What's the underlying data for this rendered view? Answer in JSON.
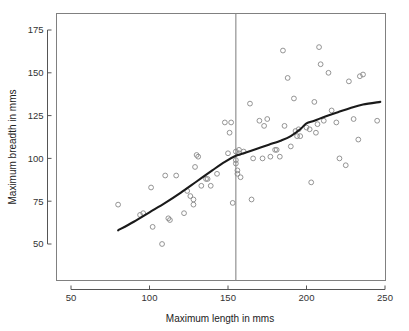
{
  "chart_data": {
    "type": "scatter",
    "title": "",
    "subtitle": "",
    "xlabel": "Maximum length in mms",
    "ylabel": "Maximum breadth in mms",
    "xlim": [
      37,
      262
    ],
    "ylim": [
      42,
      181
    ],
    "xticks": [
      50,
      100,
      150,
      200,
      250
    ],
    "xtick_labels": [
      "50",
      "100",
      "150",
      "200",
      "250"
    ],
    "yticks": [
      50,
      75,
      100,
      125,
      150,
      175
    ],
    "ytick_labels": [
      "50",
      "75",
      "100",
      "125",
      "150",
      "175"
    ],
    "grid": false,
    "legend": null,
    "point_marker": "open-circle",
    "point_color": "#888888",
    "smoother_color": "#1a1a1a",
    "annotations": [
      {
        "name": "vertical-reference-line",
        "type": "vline",
        "x": 155,
        "color": "#888888",
        "label": ""
      }
    ],
    "points": [
      [
        80,
        73
      ],
      [
        94,
        67
      ],
      [
        96,
        68
      ],
      [
        101,
        83
      ],
      [
        102,
        60
      ],
      [
        108,
        50
      ],
      [
        110,
        90
      ],
      [
        112,
        65
      ],
      [
        113,
        64
      ],
      [
        117,
        90
      ],
      [
        122,
        68
      ],
      [
        124,
        81
      ],
      [
        126,
        78
      ],
      [
        128,
        73
      ],
      [
        128,
        76
      ],
      [
        129,
        95
      ],
      [
        130,
        102
      ],
      [
        131,
        101
      ],
      [
        133,
        84
      ],
      [
        136,
        88
      ],
      [
        137,
        88
      ],
      [
        139,
        84
      ],
      [
        143,
        91
      ],
      [
        148,
        121
      ],
      [
        150,
        103
      ],
      [
        151,
        115
      ],
      [
        152,
        121
      ],
      [
        153,
        74
      ],
      [
        155,
        104
      ],
      [
        155,
        97
      ],
      [
        155,
        99
      ],
      [
        156,
        93
      ],
      [
        156,
        91
      ],
      [
        157,
        103
      ],
      [
        157,
        105
      ],
      [
        158,
        89
      ],
      [
        160,
        104
      ],
      [
        164,
        132
      ],
      [
        165,
        76
      ],
      [
        166,
        100
      ],
      [
        170,
        122
      ],
      [
        172,
        100
      ],
      [
        173,
        119
      ],
      [
        175,
        123
      ],
      [
        177,
        101
      ],
      [
        180,
        105
      ],
      [
        181,
        105
      ],
      [
        183,
        101
      ],
      [
        185,
        163
      ],
      [
        186,
        119
      ],
      [
        188,
        147
      ],
      [
        190,
        107
      ],
      [
        192,
        135
      ],
      [
        193,
        116
      ],
      [
        194,
        113
      ],
      [
        195,
        117
      ],
      [
        196,
        113
      ],
      [
        200,
        118
      ],
      [
        202,
        117
      ],
      [
        203,
        86
      ],
      [
        205,
        133
      ],
      [
        206,
        115
      ],
      [
        207,
        120
      ],
      [
        208,
        165
      ],
      [
        209,
        155
      ],
      [
        211,
        122
      ],
      [
        214,
        150
      ],
      [
        216,
        128
      ],
      [
        219,
        121
      ],
      [
        221,
        100
      ],
      [
        225,
        96
      ],
      [
        227,
        145
      ],
      [
        230,
        123
      ],
      [
        233,
        111
      ],
      [
        234,
        148
      ],
      [
        236,
        149
      ],
      [
        245,
        122
      ]
    ],
    "smoother": {
      "name": "lowess-smoother",
      "x": [
        80,
        90,
        100,
        110,
        120,
        130,
        140,
        148,
        155,
        160,
        168,
        176,
        184,
        190,
        196,
        200,
        205,
        212,
        220,
        228,
        236,
        247
      ],
      "y": [
        58,
        63,
        68.5,
        74,
        80,
        86.5,
        93,
        98,
        101.5,
        103,
        105.5,
        108,
        110.5,
        113,
        117,
        120.5,
        122,
        124.5,
        127,
        129.5,
        131.5,
        133
      ]
    }
  }
}
